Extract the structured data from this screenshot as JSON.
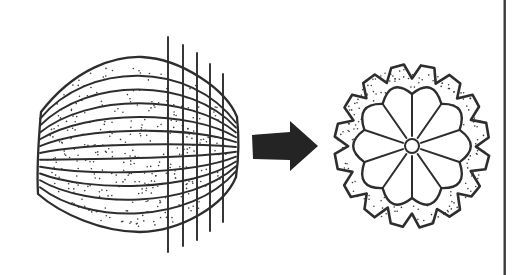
{
  "canvas": {
    "width": 517,
    "height": 275,
    "background": "#ffffff"
  },
  "colors": {
    "ink": "#2d2d2d",
    "stipple": "#3a3a3a",
    "arrow_fill": "#242424",
    "border_line": "#3a3a3a"
  },
  "melon": {
    "description": "whole ribbed fruit, side view, stippled texture",
    "outline": "M 41,112 C 75,68 115,56 142,57 C 181,59 226,89 237,117 C 239.5,140 239,156 236,177 C 224,206 181,231 140,232 C 102,232 61,214 38,194 C 36.5,167 38.6,139 41,112 Z",
    "rib_count": 11,
    "rib_left_x": 40,
    "rib_right_x": 236,
    "rib_left_y_start": 112,
    "rib_left_y_span": 82,
    "rib_right_y_start": 118,
    "rib_right_y_span": 58,
    "rib_mid_y_start": 62,
    "rib_mid_y_span": 165,
    "rib_ctrl_x1": 88,
    "rib_ctrl_x2": 190,
    "outline_stroke": 2.3,
    "rib_stroke": 1.9,
    "stipple_count": 330,
    "stipple_seed": 7,
    "stipple_cx": 137,
    "stipple_cy": 146,
    "stipple_rx": 95,
    "stipple_ry": 85,
    "stipple_power": 2.4,
    "stipple_margin": 0.88,
    "stipple_dot_r": 0.8
  },
  "cut_lines": {
    "description": "five vertical slicing lines through right half of fruit",
    "xs": [
      168,
      183,
      197,
      210,
      223
    ],
    "tops": [
      37,
      45,
      53,
      64,
      74
    ],
    "bottoms": [
      252,
      246,
      240,
      231,
      222
    ],
    "stroke": 1.9
  },
  "arrow": {
    "description": "solid right-pointing block arrow",
    "points": [
      [
        252,
        135
      ],
      [
        290,
        132
      ],
      [
        290,
        121
      ],
      [
        318,
        146
      ],
      [
        290,
        171
      ],
      [
        290,
        160
      ],
      [
        253,
        159
      ]
    ]
  },
  "cross_section": {
    "description": "cross-section with scalloped rind and radial segments",
    "cx": 412,
    "cy": 146,
    "tooth_count": 16,
    "tip_radius": 77,
    "valley_radius": 64,
    "tooth_rise_deg": 6.5,
    "tooth_flat_deg": 16,
    "gear_y_scale": 1.055,
    "gear_stroke": 2.6,
    "gear_jitter": 0.9,
    "gear_seed": 11,
    "segment_count": 10,
    "start_angle_deg": -90,
    "vertex_radius": 50,
    "bulge_ctrl_radius": 70,
    "flower_y_scale": 1.04,
    "flower_stroke": 2.4,
    "ray_stroke": 2.0,
    "ray_inner_radius": 9.5,
    "ray_outer_radius": 49,
    "core_radius": 7,
    "core_stroke": 2.0,
    "rind_dots_outer_count": 125,
    "rind_dots_outer_min_r": 63.5,
    "rind_dots_outer_max_r": 74.5,
    "rind_dots_inner_count": 40,
    "rind_dots_inner_min_r": 55,
    "rind_dots_inner_max_r": 61,
    "rind_dot_r": 0.8,
    "rind_seed": 23
  },
  "border_line": {
    "description": "vertical page-edge rule at right side",
    "x": 503.5,
    "width": 2.4,
    "y1": 0,
    "y2": 275
  }
}
